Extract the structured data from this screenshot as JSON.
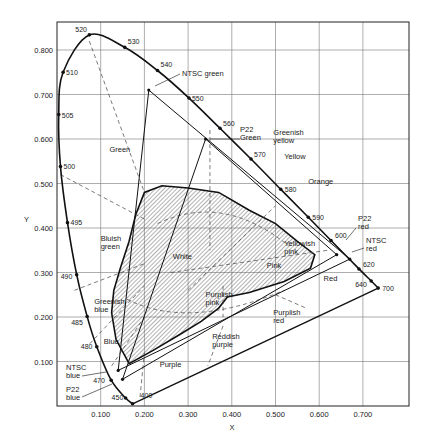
{
  "chart_data": {
    "type": "diagram",
    "xlabel": "X",
    "ylabel": "Y",
    "xlim": [
      0,
      0.8
    ],
    "ylim": [
      0,
      0.85
    ],
    "grid": true,
    "x_ticks": [
      "0.100",
      "0.200",
      "0.300",
      "0.400",
      "0.500",
      "0.600",
      "0.700"
    ],
    "x_tick_values": [
      0.1,
      0.2,
      0.3,
      0.4,
      0.5,
      0.6,
      0.7
    ],
    "y_ticks": [
      "0.100",
      "0.200",
      "0.300",
      "0.400",
      "0.500",
      "0.600",
      "0.700",
      "0.800"
    ],
    "y_tick_values": [
      0.1,
      0.2,
      0.3,
      0.4,
      0.5,
      0.6,
      0.7,
      0.8
    ],
    "spectral_locus": [
      {
        "nm": "400",
        "x": 0.173,
        "y": 0.005
      },
      {
        "nm": "450",
        "x": 0.157,
        "y": 0.018
      },
      {
        "nm": "470",
        "x": 0.124,
        "y": 0.058
      },
      {
        "nm": "480",
        "x": 0.091,
        "y": 0.133
      },
      {
        "nm": "485",
        "x": 0.069,
        "y": 0.201
      },
      {
        "nm": "490",
        "x": 0.045,
        "y": 0.295
      },
      {
        "nm": "495",
        "x": 0.024,
        "y": 0.412
      },
      {
        "nm": "500",
        "x": 0.008,
        "y": 0.538
      },
      {
        "nm": "505",
        "x": 0.004,
        "y": 0.655
      },
      {
        "nm": "510",
        "x": 0.014,
        "y": 0.75
      },
      {
        "nm": "520",
        "x": 0.074,
        "y": 0.834
      },
      {
        "nm": "530",
        "x": 0.155,
        "y": 0.806
      },
      {
        "nm": "540",
        "x": 0.23,
        "y": 0.754
      },
      {
        "nm": "550",
        "x": 0.302,
        "y": 0.692
      },
      {
        "nm": "560",
        "x": 0.373,
        "y": 0.624
      },
      {
        "nm": "570",
        "x": 0.444,
        "y": 0.555
      },
      {
        "nm": "580",
        "x": 0.512,
        "y": 0.487
      },
      {
        "nm": "590",
        "x": 0.575,
        "y": 0.424
      },
      {
        "nm": "600",
        "x": 0.627,
        "y": 0.372
      },
      {
        "nm": "620",
        "x": 0.691,
        "y": 0.308
      },
      {
        "nm": "640",
        "x": 0.719,
        "y": 0.281
      },
      {
        "nm": "700",
        "x": 0.735,
        "y": 0.265
      }
    ],
    "gamuts": [
      {
        "name": "NTSC",
        "points": [
          {
            "label": "NTSC red",
            "x": 0.67,
            "y": 0.33
          },
          {
            "label": "NTSC green",
            "x": 0.21,
            "y": 0.71
          },
          {
            "label": "NTSC blue",
            "x": 0.14,
            "y": 0.08
          }
        ]
      },
      {
        "name": "P22",
        "points": [
          {
            "label": "P22 red",
            "x": 0.64,
            "y": 0.34
          },
          {
            "label": "P22 green",
            "x": 0.34,
            "y": 0.6
          },
          {
            "label": "P22 blue",
            "x": 0.15,
            "y": 0.06
          }
        ]
      }
    ],
    "white_region": [
      [
        0.165,
        0.095
      ],
      [
        0.135,
        0.15
      ],
      [
        0.125,
        0.21
      ],
      [
        0.13,
        0.26
      ],
      [
        0.145,
        0.31
      ],
      [
        0.165,
        0.37
      ],
      [
        0.18,
        0.43
      ],
      [
        0.2,
        0.48
      ],
      [
        0.24,
        0.495
      ],
      [
        0.3,
        0.49
      ],
      [
        0.37,
        0.48
      ],
      [
        0.44,
        0.44
      ],
      [
        0.5,
        0.41
      ],
      [
        0.55,
        0.37
      ],
      [
        0.59,
        0.34
      ],
      [
        0.58,
        0.31
      ],
      [
        0.52,
        0.28
      ],
      [
        0.44,
        0.255
      ],
      [
        0.39,
        0.245
      ],
      [
        0.37,
        0.22
      ],
      [
        0.33,
        0.19
      ],
      [
        0.28,
        0.16
      ],
      [
        0.22,
        0.125
      ]
    ],
    "regions": [
      {
        "label": "Green",
        "x": 0.12,
        "y": 0.57
      },
      {
        "label": "Bluish green",
        "x": 0.1,
        "y": 0.37
      },
      {
        "label": "Greenish blue",
        "x": 0.085,
        "y": 0.23
      },
      {
        "label": "Blue",
        "x": 0.107,
        "y": 0.14
      },
      {
        "label": "Purple",
        "x": 0.235,
        "y": 0.087
      },
      {
        "label": "Reddish purple",
        "x": 0.355,
        "y": 0.15
      },
      {
        "label": "Purplish red",
        "x": 0.495,
        "y": 0.205
      },
      {
        "label": "Purplish pink",
        "x": 0.34,
        "y": 0.245
      },
      {
        "label": "Pink",
        "x": 0.48,
        "y": 0.31
      },
      {
        "label": "Yellowish pink",
        "x": 0.52,
        "y": 0.36
      },
      {
        "label": "White",
        "x": 0.265,
        "y": 0.33
      },
      {
        "label": "Red",
        "x": 0.61,
        "y": 0.28
      },
      {
        "label": "Orange",
        "x": 0.575,
        "y": 0.5
      },
      {
        "label": "Yellow",
        "x": 0.52,
        "y": 0.555
      },
      {
        "label": "Greenish yellow",
        "x": 0.495,
        "y": 0.61
      }
    ],
    "annotations": [
      {
        "text": "NTSC green"
      },
      {
        "text": "P22 Green"
      },
      {
        "text": "P22 red"
      },
      {
        "text": "NTSC red"
      },
      {
        "text": "NTSC blue"
      },
      {
        "text": "P22 blue"
      }
    ]
  }
}
